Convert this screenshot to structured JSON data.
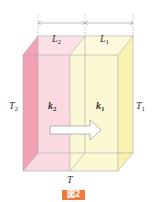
{
  "diagram": {
    "dimension_labels": [
      {
        "var": "L",
        "sub": "2"
      },
      {
        "var": "L",
        "sub": "1"
      }
    ],
    "temperature_labels": {
      "left": {
        "var": "T",
        "sub": "2"
      },
      "right": {
        "var": "T",
        "sub": "1"
      },
      "interface": {
        "var": "T",
        "sub": ""
      }
    },
    "conductivity_labels": [
      {
        "var": "k",
        "sub": "2"
      },
      {
        "var": "k",
        "sub": "1"
      }
    ],
    "colors": {
      "layer2": "#f9d5de",
      "layer2_side": "#f3a2b6",
      "layer1": "#fbf7cf",
      "layer1_side": "#f9f2b0",
      "edge": "#a9a9a9",
      "caption_bg": "#ef7a3c"
    },
    "caption": "図2"
  }
}
